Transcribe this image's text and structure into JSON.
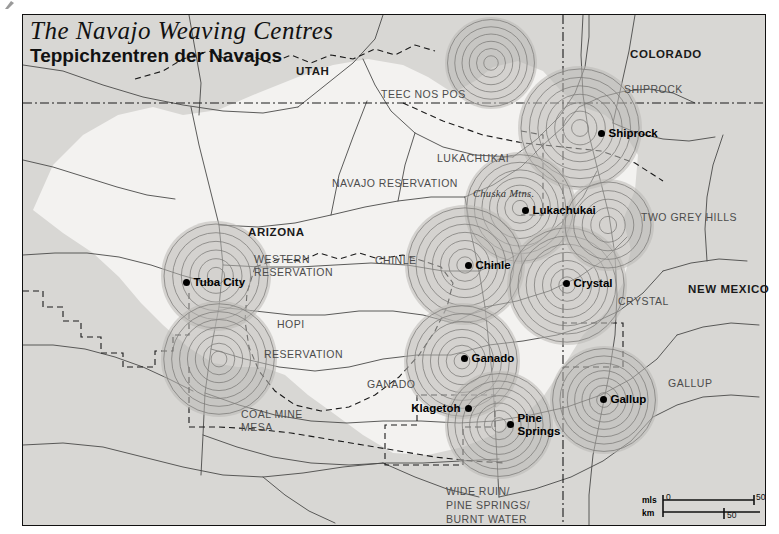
{
  "map": {
    "title_en": "The Navajo Weaving Centres",
    "title_de": "Teppichzentren der Navajos",
    "colors": {
      "outside_fill": "#d8d7d4",
      "reservation_fill": "#f3f2f0",
      "circle_fill": "#b9b8b5",
      "circle_ring": "#7d7c79",
      "line": "#4a4a48",
      "border": "#111111",
      "dot": "#000000"
    },
    "states": [
      {
        "name": "UTAH",
        "x": 296,
        "y": 65
      },
      {
        "name": "COLORADO",
        "x": 630,
        "y": 48
      },
      {
        "name": "ARIZONA",
        "x": 248,
        "y": 226
      },
      {
        "name": "NEW MEXICO",
        "x": 688,
        "y": 283
      }
    ],
    "regions": [
      {
        "name": "TEEC NOS POS",
        "x": 381,
        "y": 88
      },
      {
        "name": "SHIPROCK",
        "x": 624,
        "y": 83
      },
      {
        "name": "LUKACHUKAI",
        "x": 437,
        "y": 152
      },
      {
        "name": "NAVAJO RESERVATION",
        "x": 332,
        "y": 177
      },
      {
        "name": "TWO GREY HILLS",
        "x": 641,
        "y": 211
      },
      {
        "name": "WESTERN",
        "x": 254,
        "y": 253
      },
      {
        "name": "RESERVATION",
        "x": 254,
        "y": 266
      },
      {
        "name": "CHINLE",
        "x": 375,
        "y": 254
      },
      {
        "name": "CRYSTAL",
        "x": 618,
        "y": 295
      },
      {
        "name": "HOPI",
        "x": 277,
        "y": 318
      },
      {
        "name": "RESERVATION",
        "x": 264,
        "y": 348
      },
      {
        "name": "GANADO",
        "x": 367,
        "y": 378
      },
      {
        "name": "GALLUP",
        "x": 668,
        "y": 377
      },
      {
        "name": "COAL MINE",
        "x": 241,
        "y": 408
      },
      {
        "name": "MESA",
        "x": 241,
        "y": 421
      },
      {
        "name": "WIDE RUIN/",
        "x": 446,
        "y": 485
      },
      {
        "name": "PINE SPRINGS/",
        "x": 446,
        "y": 499
      },
      {
        "name": "BURNT WATER",
        "x": 446,
        "y": 513
      }
    ],
    "mountains": [
      {
        "name": "Chuska Mtns.",
        "x": 473,
        "y": 188
      }
    ],
    "weaving_centres": [
      {
        "name": "Shiprock",
        "dot_x": 601,
        "dot_y": 133,
        "label_side": "right",
        "stack": false,
        "circle_x": 579,
        "circle_y": 127,
        "radius": 62,
        "rings": 7
      },
      {
        "name": "Lukachukai",
        "dot_x": 525,
        "dot_y": 210,
        "label_side": "right",
        "stack": false,
        "circle_x": 519,
        "circle_y": 207,
        "radius": 56,
        "rings": 7
      },
      {
        "name": "Chinle",
        "dot_x": 468,
        "dot_y": 265,
        "label_side": "right",
        "stack": false,
        "circle_x": 464,
        "circle_y": 264,
        "radius": 60,
        "rings": 7
      },
      {
        "name": "Crystal",
        "dot_x": 566,
        "dot_y": 283,
        "label_side": "right",
        "stack": false,
        "circle_x": 566,
        "circle_y": 284,
        "radius": 60,
        "rings": 7
      },
      {
        "name": "Tuba City",
        "dot_x": 186,
        "dot_y": 282,
        "label_side": "right",
        "stack": false,
        "circle_x": 215,
        "circle_y": 275,
        "radius": 55,
        "rings": 6
      },
      {
        "name": "Ganado",
        "dot_x": 464,
        "dot_y": 358,
        "label_side": "right",
        "stack": false,
        "circle_x": 461,
        "circle_y": 360,
        "radius": 58,
        "rings": 7
      },
      {
        "name": "Klagetoh",
        "dot_x": 468,
        "dot_y": 408,
        "label_side": "left",
        "stack": false,
        "circle_x": 468,
        "circle_y": 408,
        "radius": 0,
        "rings": 0
      },
      {
        "name": "Pine Springs",
        "dot_x": 510,
        "dot_y": 418,
        "label_side": "right",
        "stack": true,
        "circle_x": 498,
        "circle_y": 424,
        "radius": 54,
        "rings": 7
      },
      {
        "name": "Gallup",
        "dot_x": 603,
        "dot_y": 399,
        "label_side": "right",
        "stack": false,
        "circle_x": 603,
        "circle_y": 399,
        "radius": 54,
        "rings": 7
      }
    ],
    "unlabelled_circles": [
      {
        "circle_x": 218,
        "circle_y": 358,
        "radius": 58,
        "rings": 7
      },
      {
        "circle_x": 490,
        "circle_y": 62,
        "radius": 46,
        "rings": 6
      },
      {
        "circle_x": 607,
        "circle_y": 224,
        "radius": 46,
        "rings": 5
      }
    ],
    "scale": {
      "unit_miles": "mls",
      "unit_km": "km",
      "miles_start": "0",
      "miles_end": "50",
      "km_tick": "50"
    }
  }
}
